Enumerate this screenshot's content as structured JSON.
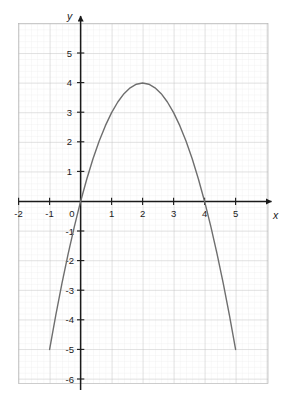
{
  "chart_data": {
    "type": "line",
    "title": "",
    "subtitle": "",
    "xlabel": "x",
    "ylabel": "y",
    "xlim": [
      -2.4,
      5.9
    ],
    "ylim": [
      -6.4,
      5.9
    ],
    "xticks": [
      -2,
      -1,
      0,
      1,
      2,
      3,
      4,
      5
    ],
    "yticks": [
      5,
      4,
      3,
      2,
      1,
      -1,
      -2,
      -3,
      -4,
      -5,
      -6
    ],
    "xtick_labels": [
      "-2",
      "-1",
      "0",
      "1",
      "2",
      "3",
      "4",
      "5"
    ],
    "ytick_labels": [
      "5",
      "4",
      "3",
      "2",
      "1",
      "-1",
      "-2",
      "-3",
      "-4",
      "-5",
      "-6"
    ],
    "grid": true,
    "minor_grid": true,
    "minor_divisions": 5,
    "legend": false,
    "legend_position": "none",
    "series": [
      {
        "name": "parabola",
        "equation": "y = -x^2 + 4x",
        "vertex": [
          2,
          4
        ],
        "roots": [
          0,
          4
        ],
        "color": "#6e6e6e",
        "x": [
          -1,
          -0.8,
          -0.6,
          -0.4,
          -0.2,
          0,
          0.2,
          0.4,
          0.6,
          0.8,
          1,
          1.2,
          1.4,
          1.6,
          1.8,
          2,
          2.2,
          2.4,
          2.6,
          2.8,
          3,
          3.2,
          3.4,
          3.6,
          3.8,
          4,
          4.2,
          4.4,
          4.6,
          4.8,
          5
        ],
        "values": [
          -5,
          -3.84,
          -2.76,
          -1.76,
          -0.84,
          0,
          0.76,
          1.44,
          2.04,
          2.56,
          3,
          3.36,
          3.64,
          3.84,
          3.96,
          4,
          3.96,
          3.84,
          3.64,
          3.36,
          3,
          2.56,
          2.04,
          1.44,
          0.76,
          0,
          -0.84,
          -1.76,
          -2.76,
          -3.84,
          -5
        ]
      }
    ],
    "annotations": []
  },
  "colors": {
    "background": "#ffffff",
    "axis": "#1a1a1a",
    "major_grid": "#b6b6b6",
    "minor_grid": "#e2e2e2",
    "curve": "#6e6e6e",
    "tick_text": "#1a1a1a"
  },
  "axis_labels": {
    "x": "x",
    "y": "y"
  }
}
